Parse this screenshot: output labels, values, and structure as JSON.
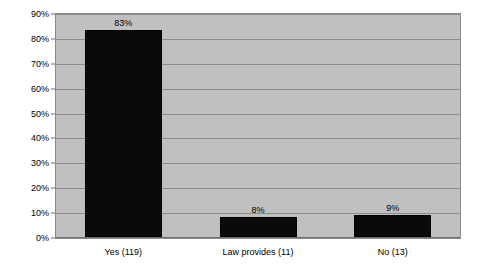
{
  "chart_data": {
    "type": "bar",
    "title": "",
    "subtitle": "",
    "xlabel": "",
    "ylabel": "",
    "categories": [
      "Yes (119)",
      "Law provides (11)",
      "No (13)"
    ],
    "values": [
      83,
      8,
      9
    ],
    "value_labels": [
      "83%",
      "8%",
      "9%"
    ],
    "counts": [
      119,
      11,
      13
    ],
    "ylim": [
      0,
      90
    ],
    "ytick_labels": [
      "0%",
      "10%",
      "20%",
      "30%",
      "40%",
      "50%",
      "60%",
      "70%",
      "80%",
      "90%"
    ],
    "ytick_values": [
      0,
      10,
      20,
      30,
      40,
      50,
      60,
      70,
      80,
      90
    ],
    "grid": true,
    "legend": false,
    "legend_position": "none",
    "series": [
      {
        "name": "Share of responses",
        "values": [
          83,
          8,
          9
        ],
        "color": "#000000"
      }
    ],
    "colors": {
      "bar": "#000000",
      "plot_background": "#c0c0c0",
      "gridline": "#8d8d8d",
      "axis": "#6f6f6f",
      "text": "#000000",
      "figure_background": "#ffffff"
    }
  }
}
